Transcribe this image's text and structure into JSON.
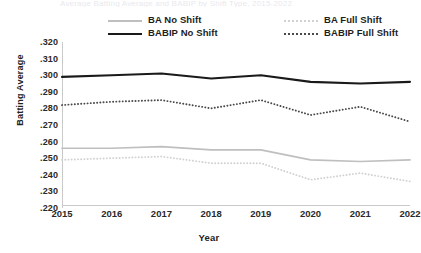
{
  "title_remnant": "Average Batting Average and BABIP by Shift Type, 2015-2022",
  "axes": {
    "ylabel": "Batting Average",
    "xlabel": "Year"
  },
  "legend": {
    "items": [
      {
        "label": "BA No Shift",
        "swatch": "solid-gray",
        "color": "#bfbfbf"
      },
      {
        "label": "BA Full Shift",
        "swatch": "dotted-gray",
        "color": "#d2d2d2"
      },
      {
        "label": "BABIP No Shift",
        "swatch": "solid-black",
        "color": "#1a1a1a"
      },
      {
        "label": "BABIP Full Shift",
        "swatch": "dotted-dark",
        "color": "#4a4a4a"
      }
    ]
  },
  "chart_data": {
    "type": "line",
    "title": "Average Batting Average and BABIP by Shift Type, 2015-2022",
    "xlabel": "Year",
    "ylabel": "Batting Average",
    "categories": [
      "2015",
      "2016",
      "2017",
      "2018",
      "2019",
      "2020",
      "2021",
      "2022"
    ],
    "x": [
      2015,
      2016,
      2017,
      2018,
      2019,
      2020,
      2021,
      2022
    ],
    "ylim": [
      0.22,
      0.32
    ],
    "yticks": [
      0.22,
      0.23,
      0.24,
      0.25,
      0.26,
      0.27,
      0.28,
      0.29,
      0.3,
      0.31,
      0.32
    ],
    "ytick_labels": [
      ".220",
      ".230",
      ".240",
      ".250",
      ".260",
      ".270",
      ".280",
      ".290",
      ".300",
      ".310",
      ".320"
    ],
    "grid": false,
    "legend_position": "top",
    "series": [
      {
        "name": "BA No Shift",
        "style": "solid",
        "color": "#bfbfbf",
        "values": [
          0.256,
          0.256,
          0.257,
          0.255,
          0.255,
          0.249,
          0.248,
          0.249
        ]
      },
      {
        "name": "BABIP No Shift",
        "style": "solid",
        "color": "#1a1a1a",
        "values": [
          0.299,
          0.3,
          0.301,
          0.298,
          0.3,
          0.296,
          0.295,
          0.296
        ]
      },
      {
        "name": "BA Full Shift",
        "style": "dotted",
        "color": "#d2d2d2",
        "values": [
          0.249,
          0.25,
          0.251,
          0.247,
          0.247,
          0.237,
          0.241,
          0.236
        ]
      },
      {
        "name": "BABIP Full Shift",
        "style": "dotted",
        "color": "#4a4a4a",
        "values": [
          0.282,
          0.284,
          0.285,
          0.28,
          0.285,
          0.276,
          0.281,
          0.272
        ]
      }
    ]
  }
}
